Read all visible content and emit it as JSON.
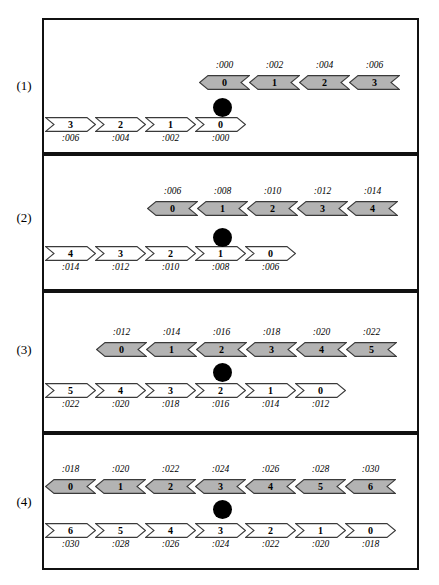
{
  "figure": {
    "type": "timing-diagram",
    "background": "#ffffff",
    "colors": {
      "gray_fill": "#b3b3b3",
      "white_fill": "#ffffff",
      "stroke": "#3a3a3a",
      "panel_border": "#111111",
      "dot": "#000000"
    },
    "panels": [
      {
        "label": "(1)",
        "upper_row": {
          "direction": "left",
          "fill": "gray",
          "offsets_position": "above",
          "start_x": 199,
          "cells": [
            {
              "num": "0",
              "offset": ":000"
            },
            {
              "num": "1",
              "offset": ":002"
            },
            {
              "num": "2",
              "offset": ":004"
            },
            {
              "num": "3",
              "offset": ":006"
            }
          ]
        },
        "lower_row": {
          "direction": "right",
          "fill": "white",
          "offsets_position": "below",
          "start_x": 45,
          "cells": [
            {
              "num": "3",
              "offset": ":006"
            },
            {
              "num": "2",
              "offset": ":004"
            },
            {
              "num": "1",
              "offset": ":002"
            },
            {
              "num": "0",
              "offset": ":000"
            }
          ]
        },
        "marker": {
          "name": "black-dot",
          "center_x": 222
        }
      },
      {
        "label": "(2)",
        "upper_row": {
          "direction": "left",
          "fill": "gray",
          "offsets_position": "above",
          "start_x": 147,
          "cells": [
            {
              "num": "0",
              "offset": ":006"
            },
            {
              "num": "1",
              "offset": ":008"
            },
            {
              "num": "2",
              "offset": ":010"
            },
            {
              "num": "3",
              "offset": ":012"
            },
            {
              "num": "4",
              "offset": ":014"
            }
          ]
        },
        "lower_row": {
          "direction": "right",
          "fill": "white",
          "offsets_position": "below",
          "start_x": 45,
          "cells": [
            {
              "num": "4",
              "offset": ":014"
            },
            {
              "num": "3",
              "offset": ":012"
            },
            {
              "num": "2",
              "offset": ":010"
            },
            {
              "num": "1",
              "offset": ":008"
            },
            {
              "num": "0",
              "offset": ":006"
            }
          ]
        },
        "marker": {
          "name": "black-dot",
          "center_x": 222
        }
      },
      {
        "label": "(3)",
        "upper_row": {
          "direction": "left",
          "fill": "gray",
          "offsets_position": "above",
          "start_x": 96,
          "cells": [
            {
              "num": "0",
              "offset": ":012"
            },
            {
              "num": "1",
              "offset": ":014"
            },
            {
              "num": "2",
              "offset": ":016"
            },
            {
              "num": "3",
              "offset": ":018"
            },
            {
              "num": "4",
              "offset": ":020"
            },
            {
              "num": "5",
              "offset": ":022"
            }
          ]
        },
        "lower_row": {
          "direction": "right",
          "fill": "white",
          "offsets_position": "below",
          "start_x": 45,
          "cells": [
            {
              "num": "5",
              "offset": ":022"
            },
            {
              "num": "4",
              "offset": ":020"
            },
            {
              "num": "3",
              "offset": ":018"
            },
            {
              "num": "2",
              "offset": ":016"
            },
            {
              "num": "1",
              "offset": ":014"
            },
            {
              "num": "0",
              "offset": ":012"
            }
          ]
        },
        "marker": {
          "name": "black-dot",
          "center_x": 222
        }
      },
      {
        "label": "(4)",
        "upper_row": {
          "direction": "left",
          "fill": "gray",
          "offsets_position": "above",
          "start_x": 45,
          "cells": [
            {
              "num": "0",
              "offset": ":018"
            },
            {
              "num": "1",
              "offset": ":020"
            },
            {
              "num": "2",
              "offset": ":022"
            },
            {
              "num": "3",
              "offset": ":024"
            },
            {
              "num": "4",
              "offset": ":026"
            },
            {
              "num": "5",
              "offset": ":028"
            },
            {
              "num": "6",
              "offset": ":030"
            }
          ]
        },
        "lower_row": {
          "direction": "right",
          "fill": "white",
          "offsets_position": "below",
          "start_x": 45,
          "cells": [
            {
              "num": "6",
              "offset": ":030"
            },
            {
              "num": "5",
              "offset": ":028"
            },
            {
              "num": "4",
              "offset": ":026"
            },
            {
              "num": "3",
              "offset": ":024"
            },
            {
              "num": "2",
              "offset": ":022"
            },
            {
              "num": "1",
              "offset": ":020"
            },
            {
              "num": "0",
              "offset": ":018"
            }
          ]
        },
        "marker": {
          "name": "black-dot",
          "center_x": 222
        }
      }
    ],
    "geometry": {
      "panel_left": 42,
      "panel_width": 377,
      "panel_tops": [
        18,
        154,
        291,
        433
      ],
      "panel_heights": [
        136,
        137,
        142,
        137
      ],
      "label_tops": [
        78,
        210,
        342,
        494
      ],
      "upper_row_top": [
        55,
        45,
        49,
        44
      ],
      "lower_row_top": [
        97,
        90,
        90,
        88
      ],
      "dot_top": [
        78,
        72,
        70,
        65
      ],
      "cell_width": 51,
      "cell_height": 15
    }
  }
}
